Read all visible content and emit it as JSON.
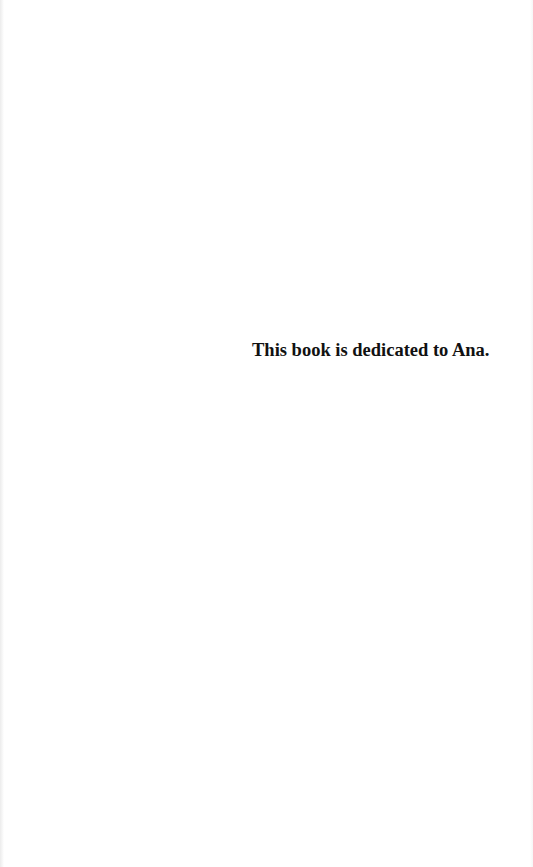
{
  "page": {
    "dedication": "This book is dedicated to Ana.",
    "background_color": "#ffffff",
    "text_color": "#111111"
  }
}
